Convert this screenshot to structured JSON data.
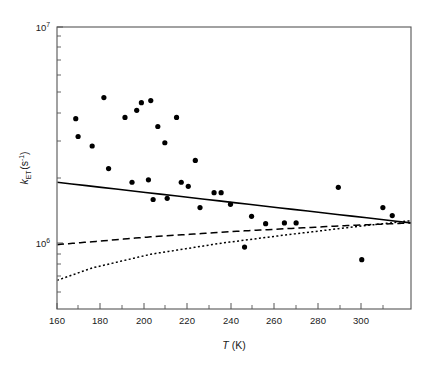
{
  "chart_data": {
    "type": "scatter",
    "title": "",
    "xlabel": "T (K)",
    "ylabel": "k_ET (s^-1)",
    "xlabel_parts": {
      "symbol": "T",
      "units": "(K)"
    },
    "ylabel_parts": {
      "symbol": "k",
      "subscript": "ET",
      "units": "(s",
      "units_exp": "-1",
      "units_close": ")"
    },
    "xlim": [
      160,
      311
    ],
    "ylim": [
      489779,
      10000000
    ],
    "yscale": "log",
    "xscale": "linear",
    "grid": false,
    "legend": null,
    "xticks": [
      160,
      180,
      200,
      220,
      240,
      260,
      280,
      300
    ],
    "xticklabels": [
      "160",
      "180",
      "200",
      "220",
      "240",
      "260",
      "280",
      "300"
    ],
    "yticks": [
      1000000,
      10000000
    ],
    "yticklabels": [
      "10",
      "10"
    ],
    "yticklabel_exponents": [
      "6",
      "7"
    ],
    "yminorticks": [
      600000,
      700000,
      800000,
      900000,
      2000000,
      3000000,
      4000000,
      5000000,
      6000000,
      7000000,
      8000000,
      9000000
    ],
    "marker": "filled-circle",
    "marker_size_px": 5.2,
    "points": [
      {
        "x": 168,
        "y": 3750000
      },
      {
        "x": 169,
        "y": 3100000
      },
      {
        "x": 175,
        "y": 2800000
      },
      {
        "x": 180,
        "y": 4700000
      },
      {
        "x": 182,
        "y": 2200000
      },
      {
        "x": 189,
        "y": 3800000
      },
      {
        "x": 192,
        "y": 1900000
      },
      {
        "x": 194,
        "y": 4100000
      },
      {
        "x": 196,
        "y": 4450000
      },
      {
        "x": 199,
        "y": 1950000
      },
      {
        "x": 200,
        "y": 4550000
      },
      {
        "x": 201,
        "y": 1580000
      },
      {
        "x": 203,
        "y": 3450000
      },
      {
        "x": 206,
        "y": 2900000
      },
      {
        "x": 207,
        "y": 1600000
      },
      {
        "x": 211,
        "y": 3800000
      },
      {
        "x": 213,
        "y": 1900000
      },
      {
        "x": 216,
        "y": 1820000
      },
      {
        "x": 219,
        "y": 2400000
      },
      {
        "x": 221,
        "y": 1450000
      },
      {
        "x": 227,
        "y": 1700000
      },
      {
        "x": 230,
        "y": 1700000
      },
      {
        "x": 234,
        "y": 1500000
      },
      {
        "x": 240,
        "y": 950000
      },
      {
        "x": 243,
        "y": 1320000
      },
      {
        "x": 249,
        "y": 1220000
      },
      {
        "x": 257,
        "y": 1230000
      },
      {
        "x": 262,
        "y": 1230000
      },
      {
        "x": 280,
        "y": 1800000
      },
      {
        "x": 290,
        "y": 830000
      },
      {
        "x": 299,
        "y": 1450000
      },
      {
        "x": 303,
        "y": 1330000
      }
    ],
    "series": [
      {
        "name": "solid-fit",
        "style": "solid",
        "x": [
          160,
          311
        ],
        "y": [
          1900000,
          1230000
        ]
      },
      {
        "name": "dashed-fit",
        "style": "dashed",
        "x": [
          160,
          200,
          240,
          280,
          311
        ],
        "y": [
          975000,
          1060000,
          1130000,
          1190000,
          1230000
        ]
      },
      {
        "name": "dotted-fit",
        "style": "dotted",
        "x": [
          160,
          175,
          200,
          230,
          260,
          290,
          311
        ],
        "y": [
          665000,
          760000,
          880000,
          990000,
          1090000,
          1190000,
          1260000
        ]
      }
    ]
  }
}
